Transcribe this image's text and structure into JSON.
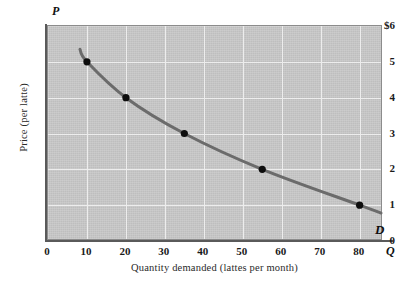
{
  "chart_data": {
    "type": "line",
    "title": "",
    "xlabel": "Quantity demanded (lattes per month)",
    "ylabel": "Price (per latte)",
    "x_axis_symbol": "Q",
    "y_axis_symbol": "P",
    "xlim": [
      0,
      86
    ],
    "ylim": [
      0,
      6
    ],
    "grid": true,
    "legend": "none",
    "series_label": "D",
    "x_ticks": [
      "0",
      "10",
      "20",
      "30",
      "40",
      "50",
      "60",
      "70",
      "80"
    ],
    "x_tick_values": [
      0,
      10,
      20,
      30,
      40,
      50,
      60,
      70,
      80
    ],
    "y_ticks": [
      "0",
      "1",
      "2",
      "3",
      "4",
      "5",
      "$6"
    ],
    "y_tick_values": [
      0,
      1,
      2,
      3,
      4,
      5,
      6
    ],
    "x": [
      10,
      20,
      35,
      55,
      80
    ],
    "values": [
      5,
      4,
      3,
      2,
      1
    ],
    "points": [
      {
        "q": 10,
        "p": 5
      },
      {
        "q": 20,
        "p": 4
      },
      {
        "q": 35,
        "p": 3
      },
      {
        "q": 55,
        "p": 2
      },
      {
        "q": 80,
        "p": 1
      }
    ],
    "colors": {
      "plot_background": "#c9c9c9",
      "gridline": "#ededed",
      "curve": "#6b6b6b",
      "point": "#0d0d0d",
      "axis": "#5a5a5a",
      "page_background": "#ffffff"
    }
  },
  "labels": {
    "y_title": "Price (per latte)",
    "x_title": "Quantity demanded (lattes per month)",
    "p_symbol": "P",
    "q_symbol": "Q",
    "curve_name": "D"
  }
}
